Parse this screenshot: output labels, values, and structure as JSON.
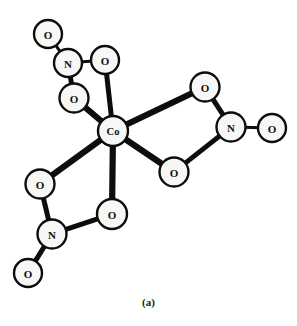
{
  "figure": {
    "caption": "(a)",
    "background_color": "#ffffff",
    "line_color": "#0d0d0d",
    "atom_fill_color": "#f7f7f5",
    "width": 297,
    "height": 326
  },
  "chart_data": {
    "type": "diagram",
    "title": "(a)",
    "subtitle": "",
    "xlabel": "",
    "ylabel": "",
    "center_atom": "Co",
    "atoms": [
      {
        "id": "co",
        "label": "Co",
        "x": 113,
        "y": 131,
        "r": 15,
        "element": "Co"
      },
      {
        "id": "o_ul_t",
        "label": "O",
        "x": 48,
        "y": 34,
        "r": 14,
        "element": "O"
      },
      {
        "id": "n_ul",
        "label": "N",
        "x": 68,
        "y": 63,
        "r": 14,
        "element": "N"
      },
      {
        "id": "o_ul_a",
        "label": "O",
        "x": 105,
        "y": 60,
        "r": 14,
        "element": "O"
      },
      {
        "id": "o_ul_b",
        "label": "O",
        "x": 74,
        "y": 98,
        "r": 14.5,
        "element": "O"
      },
      {
        "id": "o_r_a",
        "label": "O",
        "x": 205,
        "y": 87,
        "r": 14.5,
        "element": "O"
      },
      {
        "id": "n_r",
        "label": "N",
        "x": 231,
        "y": 127,
        "r": 14.5,
        "element": "N"
      },
      {
        "id": "o_r_t",
        "label": "O",
        "x": 272,
        "y": 128,
        "r": 14,
        "element": "O"
      },
      {
        "id": "o_r_b",
        "label": "O",
        "x": 174,
        "y": 172,
        "r": 14.5,
        "element": "O"
      },
      {
        "id": "o_ll_a",
        "label": "O",
        "x": 40,
        "y": 184,
        "r": 14.5,
        "element": "O"
      },
      {
        "id": "n_ll",
        "label": "N",
        "x": 52,
        "y": 234,
        "r": 14.5,
        "element": "N"
      },
      {
        "id": "o_ll_t",
        "label": "O",
        "x": 28,
        "y": 273,
        "r": 14,
        "element": "O"
      },
      {
        "id": "o_ll_b",
        "label": "O",
        "x": 112,
        "y": 214,
        "r": 15,
        "element": "O"
      }
    ],
    "bonds": [
      {
        "from": "o_ul_t",
        "to": "n_ul",
        "weight": "thin"
      },
      {
        "from": "n_ul",
        "to": "o_ul_a",
        "weight": "thin"
      },
      {
        "from": "n_ul",
        "to": "o_ul_b",
        "weight": "medium"
      },
      {
        "from": "o_ul_a",
        "to": "co",
        "weight": "medium"
      },
      {
        "from": "o_ul_b",
        "to": "co",
        "weight": "thick"
      },
      {
        "from": "o_r_a",
        "to": "n_r",
        "weight": "medium"
      },
      {
        "from": "n_r",
        "to": "o_r_t",
        "weight": "thin"
      },
      {
        "from": "n_r",
        "to": "o_r_b",
        "weight": "medium"
      },
      {
        "from": "o_r_a",
        "to": "co",
        "weight": "thick"
      },
      {
        "from": "o_r_b",
        "to": "co",
        "weight": "thick"
      },
      {
        "from": "o_ll_a",
        "to": "n_ll",
        "weight": "medium"
      },
      {
        "from": "n_ll",
        "to": "o_ll_t",
        "weight": "medium"
      },
      {
        "from": "n_ll",
        "to": "o_ll_b",
        "weight": "medium"
      },
      {
        "from": "o_ll_a",
        "to": "co",
        "weight": "thick"
      },
      {
        "from": "o_ll_b",
        "to": "co",
        "weight": "thick"
      }
    ],
    "ligand_groups": [
      {
        "name": "nitrate-upper-left",
        "atoms": [
          "o_ul_t",
          "n_ul",
          "o_ul_a",
          "o_ul_b"
        ]
      },
      {
        "name": "nitrate-right",
        "atoms": [
          "o_r_a",
          "n_r",
          "o_r_t",
          "o_r_b"
        ]
      },
      {
        "name": "nitrate-lower-left",
        "atoms": [
          "o_ll_a",
          "n_ll",
          "o_ll_t",
          "o_ll_b"
        ]
      }
    ]
  }
}
